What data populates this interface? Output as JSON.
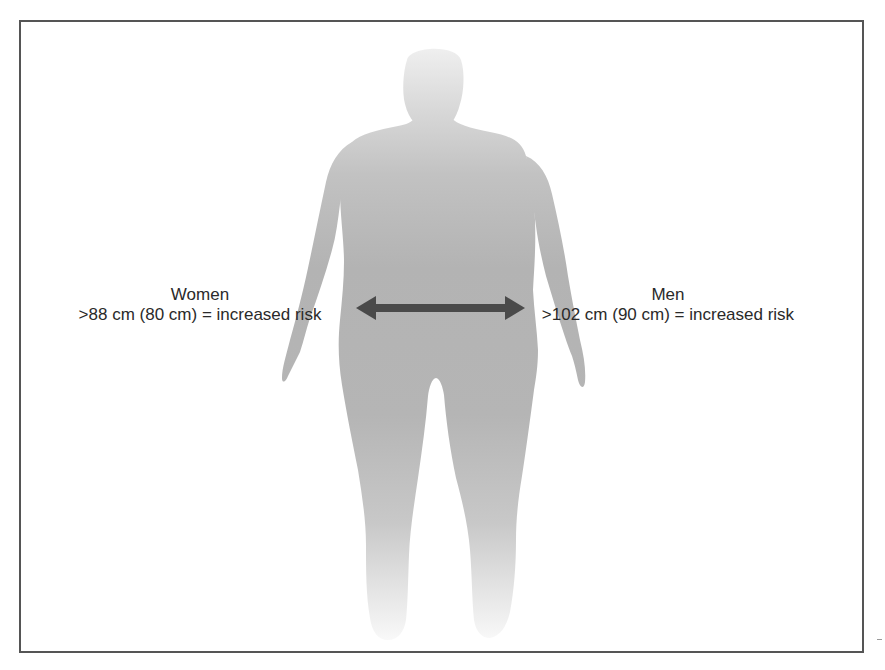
{
  "figure": {
    "measurement": "waist-circumference"
  },
  "labels": {
    "women": {
      "title": "Women",
      "criteria": ">88 cm (80 cm) = increased risk"
    },
    "men": {
      "title": "Men",
      "criteria": ">102 cm (90 cm) = increased risk"
    }
  },
  "arrow": {
    "type": "double-headed",
    "icon": "double-arrow-icon"
  },
  "colors": {
    "silhouette": "#b3b3b3",
    "arrow": "#4a4a4a",
    "text": "#2a2a2a",
    "frame": "#555555",
    "background": "#ffffff"
  }
}
